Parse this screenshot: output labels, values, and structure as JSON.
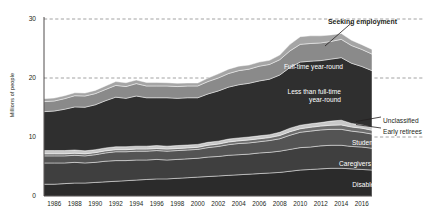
{
  "chart_data": {
    "type": "area",
    "title": "",
    "xlabel": "",
    "ylabel": "Millions of people",
    "xlim": [
      1985,
      2017
    ],
    "ylim": [
      0,
      30
    ],
    "yticks": [
      0,
      10,
      20,
      30
    ],
    "xticks": [
      1986,
      1988,
      1990,
      1992,
      1994,
      1996,
      1998,
      2000,
      2002,
      2004,
      2006,
      2008,
      2010,
      2012,
      2014,
      2016
    ],
    "grid": "horizontal-dashed",
    "legend": "inline-annotations",
    "stacked": true,
    "x": [
      1985,
      1986,
      1987,
      1988,
      1989,
      1990,
      1991,
      1992,
      1993,
      1994,
      1995,
      1996,
      1997,
      1998,
      1999,
      2000,
      2001,
      2002,
      2003,
      2004,
      2005,
      2006,
      2007,
      2008,
      2009,
      2010,
      2011,
      2012,
      2013,
      2014,
      2015,
      2016,
      2017
    ],
    "series": [
      {
        "name": "Disabled",
        "color": "#2b2b2b",
        "values": [
          2.0,
          2.0,
          2.1,
          2.2,
          2.2,
          2.3,
          2.4,
          2.5,
          2.6,
          2.7,
          2.8,
          2.9,
          2.9,
          3.0,
          3.1,
          3.2,
          3.3,
          3.4,
          3.5,
          3.6,
          3.7,
          3.8,
          3.9,
          4.0,
          4.2,
          4.4,
          4.5,
          4.6,
          4.7,
          4.7,
          4.6,
          4.5,
          4.4
        ]
      },
      {
        "name": "Caregivers",
        "color": "#3f3f3f",
        "values": [
          3.6,
          3.6,
          3.5,
          3.5,
          3.4,
          3.4,
          3.5,
          3.5,
          3.4,
          3.4,
          3.3,
          3.3,
          3.2,
          3.2,
          3.2,
          3.2,
          3.3,
          3.3,
          3.4,
          3.4,
          3.4,
          3.5,
          3.5,
          3.6,
          3.7,
          3.8,
          3.8,
          3.9,
          3.9,
          3.9,
          3.8,
          3.8,
          3.7
        ]
      },
      {
        "name": "Students",
        "color": "#545454",
        "values": [
          1.2,
          1.2,
          1.2,
          1.2,
          1.2,
          1.3,
          1.4,
          1.5,
          1.5,
          1.5,
          1.5,
          1.5,
          1.5,
          1.5,
          1.5,
          1.5,
          1.6,
          1.7,
          1.8,
          1.9,
          1.9,
          1.9,
          2.0,
          2.1,
          2.4,
          2.6,
          2.7,
          2.7,
          2.7,
          2.7,
          2.6,
          2.5,
          2.4
        ]
      },
      {
        "name": "Early retirees",
        "color": "#6e6e6e",
        "values": [
          0.35,
          0.35,
          0.35,
          0.35,
          0.35,
          0.35,
          0.35,
          0.35,
          0.35,
          0.35,
          0.35,
          0.35,
          0.35,
          0.35,
          0.35,
          0.35,
          0.4,
          0.4,
          0.45,
          0.45,
          0.5,
          0.5,
          0.5,
          0.55,
          0.6,
          0.6,
          0.65,
          0.65,
          0.7,
          0.75,
          0.7,
          0.7,
          0.65
        ]
      },
      {
        "name": "Unclassified",
        "color": "#c8c8c8",
        "values": [
          0.55,
          0.55,
          0.55,
          0.55,
          0.5,
          0.5,
          0.5,
          0.5,
          0.5,
          0.5,
          0.5,
          0.5,
          0.5,
          0.5,
          0.5,
          0.5,
          0.5,
          0.5,
          0.5,
          0.5,
          0.5,
          0.5,
          0.5,
          0.55,
          0.6,
          0.6,
          0.6,
          0.6,
          0.7,
          0.8,
          0.6,
          0.55,
          0.5
        ]
      },
      {
        "name": "Less than full-time year-round",
        "color": "#2f2f2f",
        "values": [
          6.6,
          6.7,
          7.0,
          7.3,
          7.4,
          7.6,
          8.0,
          8.4,
          8.2,
          8.5,
          8.2,
          8.1,
          8.2,
          8.0,
          8.0,
          7.9,
          8.2,
          8.5,
          8.8,
          9.0,
          9.1,
          9.3,
          9.4,
          9.7,
          10.3,
          10.7,
          10.6,
          10.5,
          10.5,
          10.6,
          10.2,
          9.9,
          9.6
        ]
      },
      {
        "name": "Full-time year-round",
        "color": "#8a8a8a",
        "values": [
          1.7,
          1.7,
          1.8,
          1.9,
          1.9,
          1.9,
          1.9,
          2.0,
          2.0,
          2.1,
          2.0,
          2.0,
          2.0,
          2.0,
          2.0,
          2.0,
          2.1,
          2.2,
          2.3,
          2.4,
          2.4,
          2.5,
          2.5,
          2.6,
          2.8,
          3.0,
          3.0,
          3.0,
          3.0,
          3.1,
          3.0,
          2.9,
          2.8
        ]
      },
      {
        "name": "Seeking employment",
        "color": "#a5a5a5",
        "values": [
          0.5,
          0.5,
          0.5,
          0.5,
          0.5,
          0.55,
          0.6,
          0.65,
          0.65,
          0.6,
          0.6,
          0.6,
          0.55,
          0.55,
          0.5,
          0.5,
          0.6,
          0.7,
          0.75,
          0.75,
          0.7,
          0.7,
          0.7,
          0.8,
          1.1,
          1.3,
          1.3,
          1.2,
          1.1,
          1.0,
          0.9,
          0.8,
          0.8
        ]
      }
    ],
    "annotations": [
      {
        "name": "seeking-employment",
        "text": "Seeking employment",
        "style": "bold-outside",
        "x": 328,
        "y": 18
      },
      {
        "name": "full-time-year-round",
        "text": "Full-time year-round",
        "style": "inside-white",
        "x": 285,
        "y": 63
      },
      {
        "name": "less-than-full-time",
        "text": "Less than full-time\nyear-round",
        "style": "inside-white",
        "x": 283,
        "y": 88
      },
      {
        "name": "unclassified",
        "text": "Unclassified",
        "style": "outside",
        "x": 383,
        "y": 117
      },
      {
        "name": "early-retirees",
        "text": "Early retirees",
        "style": "outside",
        "x": 383,
        "y": 128
      },
      {
        "name": "students",
        "text": "Students",
        "style": "inside-white",
        "x": 320,
        "y": 139
      },
      {
        "name": "caregivers",
        "text": "Caregivers",
        "style": "inside-white",
        "x": 313,
        "y": 160
      },
      {
        "name": "disabled",
        "text": "Disabled",
        "style": "inside-white",
        "x": 320,
        "y": 181
      }
    ]
  },
  "colors": {
    "background": "#ffffff",
    "text": "#231f20",
    "gridline": "#8c8c8c",
    "axis": "#231f20"
  }
}
